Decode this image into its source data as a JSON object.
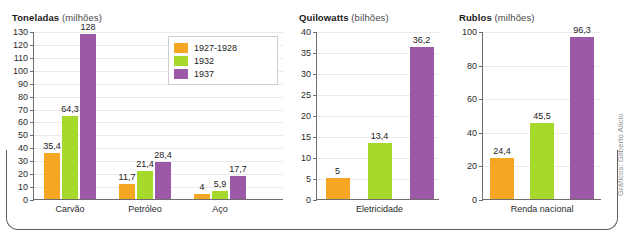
{
  "figure": {
    "credit": "Gráficos: Gilberto Alicio",
    "colors": {
      "series_1927_1928": "#F5A623",
      "series_1932": "#A6D92C",
      "series_1937": "#9B59A8",
      "axis": "#6e6e6e",
      "grid": "#eceaea",
      "frame": "#5f5f5f",
      "text": "#1b1b1b"
    },
    "legend": {
      "position": "inside-top-right-of-first-chart",
      "entries": [
        {
          "label": "1927-1928",
          "color": "#F5A623"
        },
        {
          "label": "1932",
          "color": "#A6D92C"
        },
        {
          "label": "1937",
          "color": "#9B59A8"
        }
      ]
    }
  },
  "chart_data": [
    {
      "type": "bar",
      "title": "Toneladas",
      "title_unit": "(milhões)",
      "ylabel": "Toneladas (milhões)",
      "xlabel": "",
      "ylim": [
        0,
        130
      ],
      "yticks": [
        0,
        10,
        20,
        30,
        40,
        50,
        60,
        70,
        80,
        90,
        100,
        110,
        120,
        130
      ],
      "grid": true,
      "legend": [
        "1927-1928",
        "1932",
        "1937"
      ],
      "categories": [
        "Carvão",
        "Petróleo",
        "Aço"
      ],
      "series": [
        {
          "name": "1927-1928",
          "color": "#F5A623",
          "values": [
            35.4,
            11.7,
            4
          ],
          "labels": [
            "35,4",
            "11,7",
            "4"
          ]
        },
        {
          "name": "1932",
          "color": "#A6D92C",
          "values": [
            64.3,
            21.4,
            5.9
          ],
          "labels": [
            "64,3",
            "21,4",
            "5,9"
          ]
        },
        {
          "name": "1937",
          "color": "#9B59A8",
          "values": [
            128,
            28.4,
            17.7
          ],
          "labels": [
            "128",
            "28,4",
            "17,7"
          ]
        }
      ]
    },
    {
      "type": "bar",
      "title": "Quilowatts",
      "title_unit": "(bilhões)",
      "ylabel": "Quilowatts (bilhões)",
      "xlabel": "",
      "ylim": [
        0,
        40
      ],
      "yticks": [
        0,
        5,
        10,
        15,
        20,
        25,
        30,
        35,
        40
      ],
      "grid": true,
      "categories": [
        "Eletricidade"
      ],
      "series": [
        {
          "name": "1927-1928",
          "color": "#F5A623",
          "values": [
            5
          ],
          "labels": [
            "5"
          ]
        },
        {
          "name": "1932",
          "color": "#A6D92C",
          "values": [
            13.4
          ],
          "labels": [
            "13,4"
          ]
        },
        {
          "name": "1937",
          "color": "#9B59A8",
          "values": [
            36.2
          ],
          "labels": [
            "36,2"
          ]
        }
      ]
    },
    {
      "type": "bar",
      "title": "Rublos",
      "title_unit": "(milhões)",
      "ylabel": "Rublos (milhões)",
      "xlabel": "",
      "ylim": [
        0,
        100
      ],
      "yticks": [
        0,
        20,
        40,
        60,
        80,
        100
      ],
      "grid": true,
      "categories": [
        "Renda nacional"
      ],
      "series": [
        {
          "name": "1927-1928",
          "color": "#F5A623",
          "values": [
            24.4
          ],
          "labels": [
            "24,4"
          ]
        },
        {
          "name": "1932",
          "color": "#A6D92C",
          "values": [
            45.5
          ],
          "labels": [
            "45,5"
          ]
        },
        {
          "name": "1937",
          "color": "#9B59A8",
          "values": [
            96.3
          ],
          "labels": [
            "96,3"
          ]
        }
      ]
    }
  ]
}
